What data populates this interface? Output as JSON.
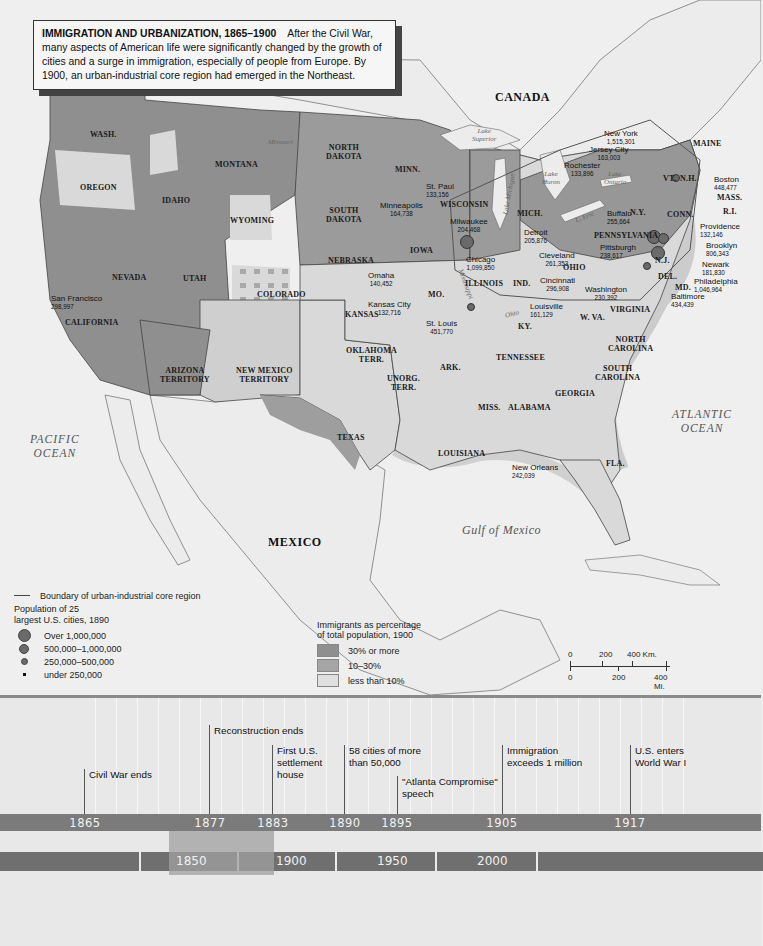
{
  "caption": {
    "title": "IMMIGRATION AND URBANIZATION, 1865–1900",
    "body": "After the Civil War, many aspects of American life were significantly changed by the growth of cities and a surge in immigration,  especially of people from Europe.  By 1900, an urban-industrial core region had emerged in the Northeast."
  },
  "countries": {
    "canada": "CANADA",
    "mexico": "MEXICO"
  },
  "oceans": {
    "pacific": "PACIFIC\nOCEAN",
    "atlantic": "ATLANTIC\nOCEAN",
    "gulf": "Gulf of Mexico"
  },
  "water_labels": {
    "superior": "Lake\nSuperior",
    "michigan": "Lake Michigan",
    "huron": "Lake\nHuron",
    "ontario": "Lake\nOntario",
    "erie": "L. Erie",
    "missouri": "Missouri",
    "mississippi": "Mississippi",
    "ohio": "Ohio"
  },
  "states": [
    "WASH.",
    "OREGON",
    "CALIFORNIA",
    "NEVADA",
    "IDAHO",
    "MONTANA",
    "WYOMING",
    "UTAH",
    "COLORADO",
    "ARIZONA\nTERRITORY",
    "NEW MEXICO\nTERRITORY",
    "NORTH\nDAKOTA",
    "SOUTH\nDAKOTA",
    "NEBRASKA",
    "KANSAS",
    "OKLAHOMA\nTERR.",
    "UNORG.\nTERR.",
    "TEXAS",
    "MINN.",
    "IOWA",
    "MO.",
    "ARK.",
    "LOUISIANA",
    "WISCONSIN",
    "ILLINOIS",
    "MICH.",
    "IND.",
    "OHIO",
    "KY.",
    "TENNESSEE",
    "MISS.",
    "ALABAMA",
    "GEORGIA",
    "FLA.",
    "SOUTH\nCAROLINA",
    "NORTH\nCAROLINA",
    "VIRGINIA",
    "W. VA.",
    "PENNSYLVANIA",
    "N.Y.",
    "VT.",
    "N.H.",
    "MAINE",
    "MASS.",
    "R.I.",
    "CONN.",
    "N.J.",
    "DEL.",
    "MD."
  ],
  "cities": [
    {
      "name": "San Francisco",
      "population": "298,997"
    },
    {
      "name": "Minneapolis",
      "population": "164,738"
    },
    {
      "name": "St. Paul",
      "population": "133,156"
    },
    {
      "name": "Milwaukee",
      "population": "204,468"
    },
    {
      "name": "Chicago",
      "population": "1,099,850"
    },
    {
      "name": "Omaha",
      "population": "140,452"
    },
    {
      "name": "Kansas City",
      "population": "132,716"
    },
    {
      "name": "St. Louis",
      "population": "451,770"
    },
    {
      "name": "Detroit",
      "population": "205,876"
    },
    {
      "name": "Cleveland",
      "population": "261,353"
    },
    {
      "name": "Cincinnati",
      "population": "296,908"
    },
    {
      "name": "Louisville",
      "population": "161,129"
    },
    {
      "name": "New Orleans",
      "population": "242,039"
    },
    {
      "name": "Rochester",
      "population": "133,896"
    },
    {
      "name": "Buffalo",
      "population": "255,664"
    },
    {
      "name": "Pittsburgh",
      "population": "238,617"
    },
    {
      "name": "Washington",
      "population": "230,392"
    },
    {
      "name": "Baltimore",
      "population": "434,439"
    },
    {
      "name": "Philadelphia",
      "population": "1,046,964"
    },
    {
      "name": "Newark",
      "population": "181,830"
    },
    {
      "name": "Brooklyn",
      "population": "806,343"
    },
    {
      "name": "New York",
      "population": "1,515,301"
    },
    {
      "name": "Jersey City",
      "population": "163,003"
    },
    {
      "name": "Boston",
      "population": "448,477"
    },
    {
      "name": "Providence",
      "population": "132,146"
    }
  ],
  "legend": {
    "boundary": "Boundary of urban-industrial core region",
    "population_title": "Population of 25\nlargest U.S. cities, 1890",
    "population_classes": [
      "Over 1,000,000",
      "500,000–1,000,000",
      "250,000–500,000",
      "under 250,000"
    ],
    "immigrant_title": "Immigrants as percentage\nof total population, 1900",
    "immigrant_classes": [
      "30% or more",
      "10–30%",
      "less than 10%"
    ],
    "colors": {
      "high": "#8f8f8f",
      "mid": "#a9a9a9",
      "low": "#d9d9d9",
      "water": "#efefef"
    }
  },
  "scale": {
    "km_ticks": [
      "0",
      "200",
      "400 Km."
    ],
    "mi_ticks": [
      "0",
      "200",
      "400 Mi."
    ]
  },
  "timeline": {
    "years": [
      "1865",
      "1877",
      "1883",
      "1890",
      "1895",
      "1905",
      "1917"
    ],
    "events": [
      {
        "year": "1865",
        "label": "Civil War ends"
      },
      {
        "year": "1877",
        "label": "Reconstruction ends"
      },
      {
        "year": "1883",
        "label": "First U.S.\nsettlement\nhouse"
      },
      {
        "year": "1890",
        "label": "58 cities of more\nthan 50,000"
      },
      {
        "year": "1895",
        "label": "\"Atlanta Compromise\"\nspeech"
      },
      {
        "year": "1905",
        "label": "Immigration\nexceeds 1 million"
      },
      {
        "year": "1917",
        "label": "U.S. enters\nWorld War I"
      }
    ],
    "eras": [
      "1850",
      "1900",
      "1950",
      "2000"
    ]
  }
}
